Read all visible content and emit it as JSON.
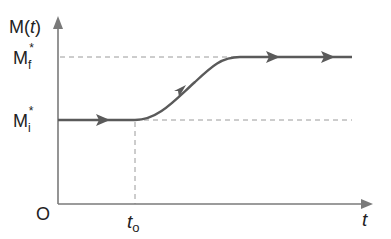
{
  "diagram": {
    "y_axis_label": {
      "main": "M(",
      "var": "t",
      "close": ")"
    },
    "x_axis_label": "t",
    "origin_label": "O",
    "mf_label": {
      "main": "M",
      "sub": "f",
      "sup": "*"
    },
    "mi_label": {
      "main": "M",
      "sub": "i",
      "sup": "*"
    },
    "t0_label": {
      "main": "t",
      "sub": "o"
    },
    "colors": {
      "axis": "#7a7a7a",
      "curve": "#5a5a5a",
      "dashed": "#9a9a9a",
      "text": "#222222"
    }
  }
}
